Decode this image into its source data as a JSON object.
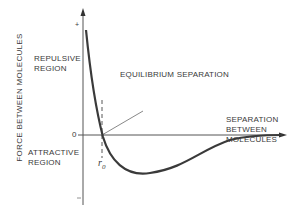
{
  "diagram": {
    "y_axis_label": "FORCE BETWEEN MOLECULES",
    "x_axis_label": [
      "SEPARATION",
      "BETWEEN",
      "MOLECULES"
    ],
    "y_ticks": {
      "plus": "+",
      "zero": "0",
      "minus": "−"
    },
    "regions": {
      "repulsive": [
        "REPULSIVE",
        "REGION"
      ],
      "attractive": [
        "ATTRACTIVE",
        "REGION"
      ]
    },
    "annotation": "EQUILIBRIUM SEPARATION",
    "r0_symbol": "r",
    "r0_subscript": "0",
    "colors": {
      "line": "#3a3a3a",
      "background": "#ffffff"
    }
  }
}
